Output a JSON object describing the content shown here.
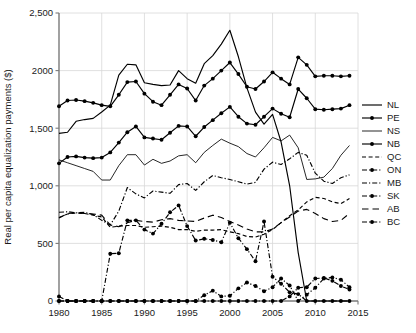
{
  "chart_data": {
    "type": "line",
    "title": "",
    "xlabel": "",
    "ylabel": "Real per capita equalization payments ($)",
    "xlim": [
      1980,
      2015
    ],
    "ylim": [
      0,
      2500
    ],
    "xticks": [
      1980,
      1985,
      1990,
      1995,
      2000,
      2005,
      2010,
      2015
    ],
    "xticklabels": [
      "1980",
      "1985",
      "1990",
      "1995",
      "2000",
      "2005",
      "2010",
      "2015"
    ],
    "yticks": [
      0,
      500,
      1000,
      1500,
      2000,
      2500
    ],
    "yticklabels": [
      "0",
      "500",
      "1,000",
      "1,500",
      "2000",
      "2,500"
    ],
    "grid": "both",
    "legend_position": "right",
    "color": "#000000",
    "x": [
      1980,
      1981,
      1982,
      1983,
      1984,
      1985,
      1986,
      1987,
      1988,
      1989,
      1990,
      1991,
      1992,
      1993,
      1994,
      1995,
      1996,
      1997,
      1998,
      1999,
      2000,
      2001,
      2002,
      2003,
      2004,
      2005,
      2006,
      2007,
      2008,
      2009,
      2010,
      2011,
      2012,
      2013,
      2014
    ],
    "series": [
      {
        "name": "NL",
        "style": "solid",
        "marker": "none",
        "values": [
          1455,
          1465,
          1560,
          1575,
          1585,
          1640,
          1700,
          1960,
          2055,
          2050,
          1895,
          1880,
          1870,
          1875,
          2000,
          1930,
          1890,
          2060,
          2130,
          2230,
          2350,
          2120,
          1850,
          1640,
          1535,
          1620,
          1380,
          1000,
          420,
          0,
          0,
          0,
          0,
          0,
          0
        ]
      },
      {
        "name": "PE",
        "style": "solid",
        "marker": "circle",
        "values": [
          1690,
          1740,
          1745,
          1735,
          1720,
          1700,
          1690,
          1790,
          1900,
          1905,
          1800,
          1730,
          1700,
          1790,
          1880,
          1845,
          1740,
          1870,
          1930,
          2000,
          2070,
          1970,
          1860,
          1840,
          1905,
          1985,
          1930,
          1880,
          2115,
          2050,
          1950,
          1955,
          1955,
          1950,
          1955
        ]
      },
      {
        "name": "NS",
        "style": "thin",
        "marker": "none",
        "values": [
          1225,
          1200,
          1175,
          1150,
          1125,
          1050,
          1050,
          1175,
          1270,
          1270,
          1180,
          1230,
          1195,
          1215,
          1260,
          1270,
          1200,
          1290,
          1350,
          1405,
          1370,
          1340,
          1280,
          1250,
          1330,
          1420,
          1390,
          1440,
          1330,
          1055,
          1060,
          1075,
          1150,
          1265,
          1350
        ]
      },
      {
        "name": "NB",
        "style": "solid",
        "marker": "circle",
        "values": [
          1195,
          1250,
          1255,
          1245,
          1240,
          1245,
          1290,
          1375,
          1465,
          1515,
          1420,
          1410,
          1400,
          1460,
          1520,
          1515,
          1430,
          1510,
          1570,
          1630,
          1685,
          1600,
          1540,
          1530,
          1600,
          1670,
          1625,
          1595,
          1840,
          1760,
          1665,
          1660,
          1665,
          1670,
          1700
        ]
      },
      {
        "name": "QC",
        "style": "dashed",
        "marker": "none",
        "values": [
          725,
          755,
          765,
          760,
          745,
          730,
          640,
          650,
          655,
          655,
          640,
          645,
          650,
          640,
          620,
          620,
          605,
          615,
          615,
          620,
          600,
          585,
          560,
          555,
          580,
          620,
          680,
          740,
          790,
          860,
          900,
          890,
          860,
          845,
          890
        ]
      },
      {
        "name": "ON",
        "style": "dashdot",
        "marker": "circle",
        "values": [
          40,
          0,
          0,
          0,
          0,
          0,
          0,
          0,
          0,
          0,
          0,
          0,
          0,
          0,
          0,
          0,
          0,
          0,
          0,
          0,
          0,
          0,
          0,
          0,
          0,
          0,
          0,
          40,
          115,
          120,
          195,
          200,
          175,
          130,
          100
        ]
      },
      {
        "name": "MB",
        "style": "dashdot",
        "marker": "none",
        "values": [
          770,
          775,
          765,
          770,
          750,
          700,
          660,
          780,
          985,
          930,
          895,
          955,
          945,
          935,
          1010,
          1020,
          960,
          1035,
          1090,
          1070,
          1055,
          1035,
          1015,
          1030,
          1145,
          1205,
          1185,
          1235,
          1290,
          1265,
          1110,
          1040,
          1020,
          1070,
          1095
        ]
      },
      {
        "name": "SK",
        "style": "dashdot",
        "marker": "circle",
        "values": [
          0,
          0,
          0,
          0,
          0,
          0,
          410,
          415,
          700,
          700,
          620,
          585,
          670,
          770,
          830,
          650,
          525,
          540,
          530,
          510,
          680,
          545,
          450,
          345,
          690,
          210,
          150,
          75,
          60,
          0,
          0,
          0,
          0,
          0,
          0
        ]
      },
      {
        "name": "AB",
        "style": "longdash",
        "marker": "none",
        "values": [
          720,
          760,
          765,
          760,
          755,
          745,
          660,
          645,
          680,
          700,
          690,
          685,
          705,
          715,
          700,
          695,
          690,
          720,
          745,
          725,
          690,
          660,
          625,
          600,
          600,
          625,
          680,
          730,
          780,
          795,
          760,
          715,
          690,
          700,
          760
        ]
      },
      {
        "name": "BC",
        "style": "dashdot",
        "marker": "circle",
        "values": [
          0,
          0,
          0,
          0,
          0,
          0,
          0,
          0,
          0,
          0,
          0,
          0,
          0,
          0,
          0,
          0,
          0,
          50,
          90,
          40,
          45,
          110,
          160,
          130,
          85,
          120,
          195,
          135,
          0,
          55,
          115,
          195,
          205,
          185,
          120
        ]
      }
    ]
  },
  "legend": {
    "items": [
      {
        "label": "NL"
      },
      {
        "label": "PE"
      },
      {
        "label": "NS"
      },
      {
        "label": "NB"
      },
      {
        "label": "QC"
      },
      {
        "label": "ON"
      },
      {
        "label": "MB"
      },
      {
        "label": "SK"
      },
      {
        "label": "AB"
      },
      {
        "label": "BC"
      }
    ]
  }
}
